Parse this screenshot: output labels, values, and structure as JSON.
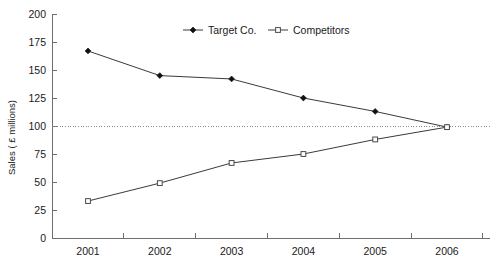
{
  "chart_data": {
    "type": "line",
    "title": "",
    "xlabel": "",
    "ylabel": "Sales ( £ millions)",
    "categories": [
      "2001",
      "2002",
      "2003",
      "2004",
      "2005",
      "2006"
    ],
    "ylim": [
      0,
      200
    ],
    "yticks": [
      0,
      25,
      50,
      75,
      100,
      125,
      150,
      175,
      200
    ],
    "ytick_labels": [
      "0",
      "25",
      "50",
      "75",
      "100",
      "125",
      "150",
      "175",
      "200"
    ],
    "grid": false,
    "reference_line": {
      "value": 100,
      "style": "dotted"
    },
    "legend_position": "top-center",
    "series": [
      {
        "name": "Target Co.",
        "marker": "filled-diamond",
        "values": [
          167,
          145,
          142,
          125,
          113,
          99
        ]
      },
      {
        "name": "Competitors",
        "marker": "open-square",
        "values": [
          33,
          49,
          67,
          75,
          88,
          99
        ]
      }
    ]
  },
  "legend": {
    "items": [
      {
        "label": "Target Co."
      },
      {
        "label": "Competitors"
      }
    ]
  },
  "colors": {
    "line": "#3a3a3a",
    "axis": "#6e6e6e",
    "reference": "#8a8a8a",
    "text": "#1a1a1a",
    "background": "#ffffff"
  }
}
